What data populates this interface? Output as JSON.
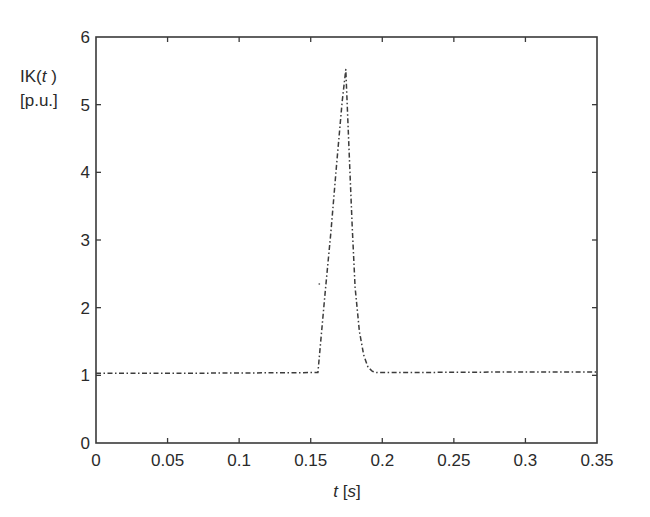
{
  "chart_data": {
    "type": "line",
    "title": "",
    "xlabel": "t [s]",
    "ylabel": "IK(t) [p.u.]",
    "ylabel_lines": [
      "IK(t)",
      "[p.u.]"
    ],
    "xlim": [
      0,
      0.35
    ],
    "ylim": [
      0,
      6
    ],
    "xticks": [
      0,
      0.05,
      0.1,
      0.15,
      0.2,
      0.25,
      0.3,
      0.35
    ],
    "xtick_labels": [
      "0",
      "0.05",
      "0.1",
      "0.15",
      "0.2",
      "0.25",
      "0.3",
      "0.35"
    ],
    "yticks": [
      0,
      1,
      2,
      3,
      4,
      5,
      6
    ],
    "ytick_labels": [
      "0",
      "1",
      "2",
      "3",
      "4",
      "5",
      "6"
    ],
    "grid": false,
    "legend": null,
    "line_style": "dash-dot",
    "series": [
      {
        "name": "IK(t)",
        "x": [
          0,
          0.05,
          0.1,
          0.15,
          0.155,
          0.16,
          0.164,
          0.168,
          0.172,
          0.1745,
          0.177,
          0.179,
          0.181,
          0.184,
          0.187,
          0.19,
          0.193,
          0.196,
          0.2,
          0.25,
          0.3,
          0.35
        ],
        "y": [
          1.03,
          1.03,
          1.035,
          1.04,
          1.04,
          2.2,
          3.1,
          4.1,
          5.05,
          5.52,
          4.2,
          3.2,
          2.3,
          1.65,
          1.3,
          1.12,
          1.06,
          1.04,
          1.04,
          1.045,
          1.05,
          1.05
        ]
      }
    ],
    "annotations": [
      {
        "type": "stray-point",
        "x": 0.156,
        "y": 2.35
      }
    ]
  }
}
